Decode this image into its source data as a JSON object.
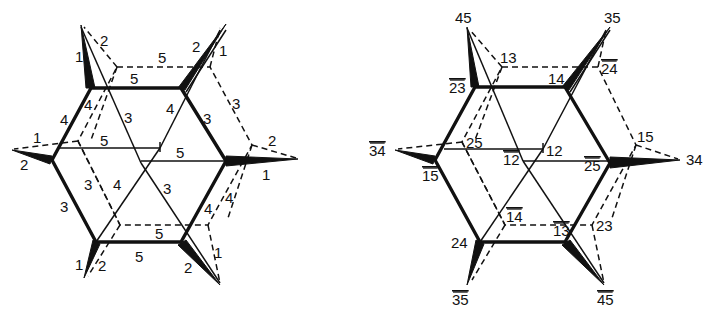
{
  "figure": {
    "left_diagram": {
      "edge_labels": {
        "top_left_spike_outer": "1",
        "top_left_spike_dashed": "2",
        "top_dashed": "5",
        "top_solid": "5",
        "top_right_spike_2": "2",
        "top_right_spike_1": "1",
        "upper_left_outer": "4",
        "upper_left_inner": "4",
        "inner_left_3": "3",
        "inner_right_4": "4",
        "upper_right_outer": "3",
        "right_dashed_3": "3",
        "left_spike_1": "1",
        "left_spike_2": "2",
        "middle_5_left": "5",
        "middle_5_right": "5",
        "right_spike_2": "2",
        "right_spike_1": "1",
        "lower_left_dashed_3": "3",
        "lower_inner_4": "4",
        "lower_inner_3": "3",
        "lower_left_outer": "3",
        "lower_right_dashed_4": "4",
        "lower_right_outer_4": "4",
        "bottom_dashed_5": "5",
        "bottom_solid_5": "5",
        "bottom_left_spike_1": "1",
        "bottom_left_spike_2": "2",
        "bottom_right_spike_2": "2",
        "bottom_right_spike_1": "1"
      }
    },
    "right_diagram": {
      "vertex_labels": {
        "top_left_tip": "45",
        "top_right_tip": "35",
        "dashed_top_left": "13",
        "dashed_top_right": "24",
        "outer_top_left": "23",
        "outer_top_right": "14",
        "left_tip": "34",
        "dashed_left": "25",
        "center_upper": "12",
        "center_lower": "12",
        "dashed_right": "15",
        "right_tip": "34",
        "outer_left": "15",
        "outer_right": "25",
        "dashed_bottom_left": "14",
        "dashed_bottom_right": "23",
        "outer_bottom_left": "24",
        "outer_bottom_right": "13",
        "bottom_left_tip": "35",
        "bottom_right_tip": "45"
      },
      "overlined": [
        "dashed_top_right",
        "outer_top_left",
        "left_tip",
        "center_lower",
        "outer_left",
        "outer_right",
        "dashed_bottom_left",
        "outer_bottom_right",
        "bottom_left_tip",
        "bottom_right_tip"
      ]
    }
  }
}
